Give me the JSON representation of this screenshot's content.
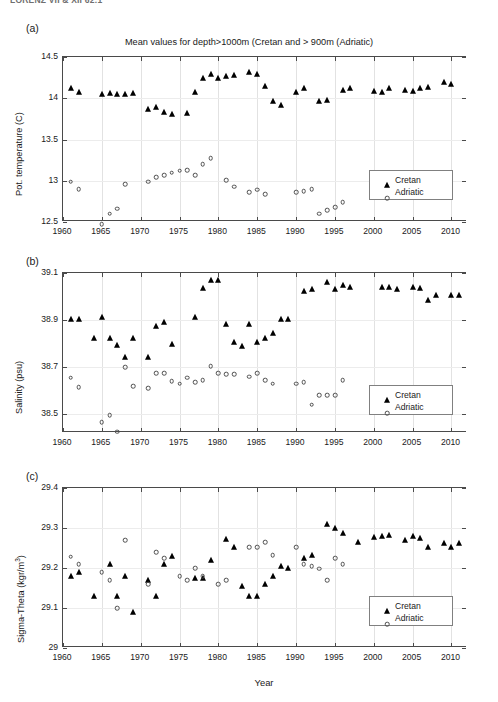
{
  "running_head": "LORENZ VII & XII 62:1",
  "figure": {
    "xlabel": "Year",
    "legend": {
      "cretan": "Cretan",
      "adriatic": "Adriatic"
    }
  },
  "panels": [
    {
      "tag": "(a)",
      "title": "Mean values for depth>1000m (Cretan and > 900m (Adriatic)",
      "ylabel": "Pot. temperature (C)",
      "yticks": [
        "12.5",
        "13",
        "13.5",
        "14",
        "14.5"
      ],
      "xticks": [
        "1960",
        "1965",
        "1970",
        "1975",
        "1980",
        "1985",
        "1990",
        "1995",
        "2000",
        "2005",
        "2010"
      ]
    },
    {
      "tag": "(b)",
      "title": "",
      "ylabel": "Salinity (psu)",
      "yticks": [
        "38.5",
        "38.7",
        "38.9",
        "39.1"
      ],
      "xticks": [
        "1960",
        "1965",
        "1970",
        "1975",
        "1980",
        "1985",
        "1990",
        "1995",
        "2000",
        "2005",
        "2010"
      ]
    },
    {
      "tag": "(c)",
      "title": "",
      "ylabel_pre": "Sigma-Theta (kgr/m",
      "ylabel_sup": "3",
      "ylabel_post": ")",
      "yticks": [
        "29",
        "29.1",
        "29.2",
        "29.3",
        "29.4"
      ],
      "xticks": [
        "1960",
        "1965",
        "1970",
        "1975",
        "1980",
        "1985",
        "1990",
        "1995",
        "2000",
        "2005",
        "2010"
      ]
    }
  ],
  "chart_data": [
    {
      "type": "scatter",
      "panel": "(a)",
      "title": "Mean values for depth>1000m (Cretan and > 900m (Adriatic)",
      "xlabel": "Year",
      "ylabel": "Pot. temperature (C)",
      "xlim": [
        1960,
        2012
      ],
      "ylim": [
        12.5,
        14.5
      ],
      "grid": true,
      "legend_position": "lower-right",
      "series": [
        {
          "name": "Cretan",
          "marker": "filled-triangle",
          "x": [
            1961,
            1962,
            1965,
            1966,
            1967,
            1968,
            1969,
            1971,
            1972,
            1973,
            1974,
            1976,
            1977,
            1978,
            1979,
            1980,
            1981,
            1982,
            1984,
            1985,
            1986,
            1987,
            1988,
            1990,
            1991,
            1993,
            1994,
            1996,
            1997,
            2000,
            2001,
            2002,
            2004,
            2005,
            2006,
            2007,
            2009,
            2010
          ],
          "y": [
            14.13,
            14.08,
            14.05,
            14.06,
            14.05,
            14.05,
            14.06,
            13.87,
            13.9,
            13.83,
            13.81,
            13.82,
            14.07,
            14.25,
            14.29,
            14.24,
            14.27,
            14.28,
            14.32,
            14.29,
            14.15,
            13.97,
            13.92,
            14.07,
            14.12,
            13.97,
            13.98,
            14.1,
            14.12,
            14.09,
            14.08,
            14.12,
            14.1,
            14.09,
            14.13,
            14.14,
            14.2,
            14.17
          ]
        },
        {
          "name": "Adriatic",
          "marker": "open-circle",
          "x": [
            1961,
            1962,
            1965,
            1966,
            1967,
            1968,
            1971,
            1972,
            1973,
            1974,
            1975,
            1976,
            1977,
            1978,
            1979,
            1981,
            1982,
            1984,
            1985,
            1986,
            1990,
            1991,
            1992,
            1993,
            1994,
            1995,
            1996
          ],
          "y": [
            12.99,
            12.9,
            12.47,
            12.6,
            12.66,
            12.96,
            12.99,
            13.04,
            13.07,
            13.1,
            13.12,
            13.13,
            13.07,
            13.2,
            13.27,
            13.01,
            12.93,
            12.86,
            12.89,
            12.84,
            12.86,
            12.87,
            12.9,
            12.6,
            12.64,
            12.68,
            12.74
          ]
        }
      ]
    },
    {
      "type": "scatter",
      "panel": "(b)",
      "title": "",
      "xlabel": "Year",
      "ylabel": "Salinity (psu)",
      "xlim": [
        1960,
        2012
      ],
      "ylim": [
        38.42,
        39.1
      ],
      "grid": true,
      "legend_position": "lower-right",
      "series": [
        {
          "name": "Cretan",
          "marker": "filled-triangle",
          "x": [
            1961,
            1962,
            1964,
            1965,
            1966,
            1967,
            1968,
            1969,
            1971,
            1972,
            1973,
            1974,
            1977,
            1978,
            1979,
            1980,
            1981,
            1982,
            1983,
            1984,
            1985,
            1986,
            1987,
            1988,
            1989,
            1991,
            1992,
            1994,
            1995,
            1996,
            1997,
            2001,
            2002,
            2003,
            2005,
            2006,
            2007,
            2008,
            2010,
            2011
          ],
          "y": [
            38.905,
            38.905,
            38.825,
            38.915,
            38.825,
            38.795,
            38.745,
            38.825,
            38.745,
            38.875,
            38.89,
            38.8,
            38.915,
            39.035,
            39.07,
            39.07,
            38.885,
            38.805,
            38.79,
            38.885,
            38.805,
            38.825,
            38.845,
            38.905,
            38.905,
            39.025,
            39.03,
            39.06,
            39.03,
            39.05,
            39.04,
            39.04,
            39.04,
            39.03,
            39.04,
            39.035,
            38.985,
            39.005,
            39.005,
            39.005
          ]
        },
        {
          "name": "Adriatic",
          "marker": "open-circle",
          "x": [
            1961,
            1962,
            1965,
            1966,
            1967,
            1968,
            1969,
            1971,
            1972,
            1973,
            1974,
            1975,
            1976,
            1977,
            1978,
            1979,
            1980,
            1981,
            1982,
            1984,
            1985,
            1986,
            1987,
            1990,
            1991,
            1992,
            1993,
            1994,
            1995,
            1996
          ],
          "y": [
            38.655,
            38.615,
            38.465,
            38.495,
            38.425,
            38.7,
            38.62,
            38.61,
            38.675,
            38.675,
            38.64,
            38.63,
            38.655,
            38.635,
            38.645,
            38.705,
            38.675,
            38.67,
            38.67,
            38.66,
            38.675,
            38.645,
            38.63,
            38.63,
            38.635,
            38.54,
            38.58,
            38.58,
            38.58,
            38.645
          ]
        }
      ]
    },
    {
      "type": "scatter",
      "panel": "(c)",
      "title": "",
      "xlabel": "Year",
      "ylabel": "Sigma-Theta (kgr/m3)",
      "xlim": [
        1960,
        2012
      ],
      "ylim": [
        29.0,
        29.4
      ],
      "grid": true,
      "legend_position": "lower-right",
      "series": [
        {
          "name": "Cretan",
          "marker": "filled-triangle",
          "x": [
            1961,
            1962,
            1964,
            1966,
            1967,
            1968,
            1969,
            1971,
            1972,
            1973,
            1974,
            1977,
            1978,
            1979,
            1981,
            1982,
            1983,
            1984,
            1985,
            1986,
            1987,
            1988,
            1989,
            1991,
            1992,
            1994,
            1995,
            1996,
            1998,
            2000,
            2001,
            2002,
            2004,
            2005,
            2006,
            2007,
            2009,
            2010,
            2011
          ],
          "y": [
            29.18,
            29.19,
            29.13,
            29.21,
            29.13,
            29.18,
            29.09,
            29.17,
            29.13,
            29.21,
            29.23,
            29.175,
            29.175,
            29.22,
            29.272,
            29.252,
            29.155,
            29.13,
            29.13,
            29.16,
            29.18,
            29.205,
            29.2,
            29.225,
            29.232,
            29.31,
            29.3,
            29.288,
            29.265,
            29.278,
            29.28,
            29.282,
            29.27,
            29.28,
            29.275,
            29.252,
            29.263,
            29.252,
            29.263
          ]
        },
        {
          "name": "Adriatic",
          "marker": "open-circle",
          "x": [
            1961,
            1962,
            1965,
            1966,
            1967,
            1968,
            1971,
            1972,
            1973,
            1975,
            1976,
            1977,
            1978,
            1980,
            1981,
            1984,
            1985,
            1986,
            1987,
            1990,
            1991,
            1992,
            1993,
            1994,
            1995,
            1996
          ],
          "y": [
            29.228,
            29.21,
            29.19,
            29.17,
            29.1,
            29.27,
            29.16,
            29.24,
            29.225,
            29.18,
            29.17,
            29.2,
            29.18,
            29.16,
            29.17,
            29.252,
            29.252,
            29.265,
            29.232,
            29.252,
            29.21,
            29.205,
            29.198,
            29.17,
            29.225,
            29.21
          ]
        }
      ]
    }
  ]
}
